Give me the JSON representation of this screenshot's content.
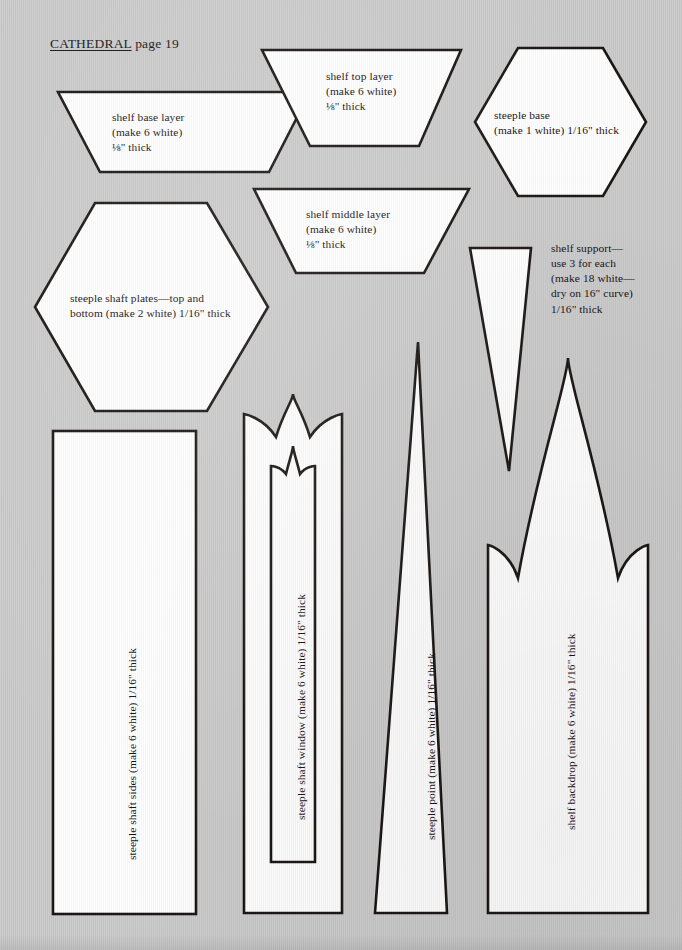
{
  "page": {
    "header_title": "CATHEDRAL",
    "header_rest": " page 19",
    "background_color": "#cacaca",
    "ink_color": "#15110f",
    "piece_fill": "#ffffff",
    "width": 682,
    "height": 950
  },
  "pieces": [
    {
      "id": "shelf-base-layer",
      "shape": "trapezoid",
      "label": "shelf base layer\n(make 6 white)\n⅛\" thick"
    },
    {
      "id": "shelf-top-layer",
      "shape": "trapezoid",
      "label": "shelf top layer\n(make 6 white)\n⅛\" thick"
    },
    {
      "id": "steeple-base",
      "shape": "hexagon",
      "label": "steeple base\n(make 1 white) 1/16\" thick"
    },
    {
      "id": "shelf-middle-layer",
      "shape": "trapezoid",
      "label": "shelf middle layer\n(make 6 white)\n⅛\" thick"
    },
    {
      "id": "steeple-shaft-plates",
      "shape": "hexagon",
      "label": "steeple shaft plates—top and\nbottom (make 2 white) 1/16\" thick"
    },
    {
      "id": "shelf-support",
      "shape": "narrow-triangle",
      "label": "shelf support—\nuse 3 for each\n(make 18 white—\ndry on 16\" curve)\n1/16\" thick"
    },
    {
      "id": "steeple-shaft-sides",
      "shape": "rectangle",
      "label": "steeple shaft sides (make 6 white) 1/16\" thick"
    },
    {
      "id": "steeple-shaft-window",
      "shape": "gothic-arch-with-window",
      "label": "steeple shaft window (make 6 white) 1/16\" thick"
    },
    {
      "id": "steeple-point",
      "shape": "tall-triangle",
      "label": "steeple point (make 6 white) 1/16\" thick"
    },
    {
      "id": "shelf-backdrop",
      "shape": "spire-backdrop",
      "label": "shelf backdrop (make 6 white) 1/16\" thick"
    }
  ]
}
